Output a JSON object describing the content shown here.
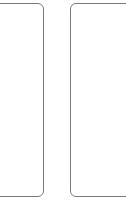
{
  "panels": [
    {
      "id": "left",
      "content": ""
    },
    {
      "id": "right",
      "content": ""
    }
  ],
  "colors": {
    "border": "#7a7a7a",
    "background": "#ffffff"
  }
}
